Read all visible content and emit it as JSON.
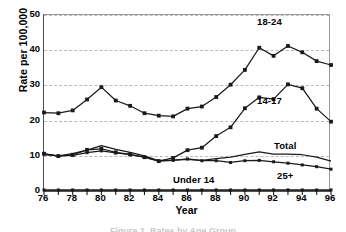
{
  "chart_data": {
    "type": "line",
    "title": "",
    "xlabel": "Year",
    "ylabel": "Rate per 100,000",
    "xlim": [
      76,
      96
    ],
    "ylim": [
      0,
      50
    ],
    "ytick_values": [
      0,
      10,
      20,
      30,
      40,
      50
    ],
    "ytick_labels": [
      "0",
      "10",
      "20",
      "30",
      "40",
      "50"
    ],
    "xtick_values": [
      76,
      78,
      80,
      82,
      84,
      86,
      88,
      90,
      92,
      94,
      96
    ],
    "xtick_labels": [
      "76",
      "78",
      "80",
      "82",
      "84",
      "86",
      "88",
      "90",
      "92",
      "94",
      "96"
    ],
    "x": [
      76,
      77,
      78,
      79,
      80,
      81,
      82,
      83,
      84,
      85,
      86,
      87,
      88,
      89,
      90,
      91,
      92,
      93,
      94,
      95,
      96
    ],
    "grid": "horizontal-dashed",
    "legend_position": "inline-annotations",
    "series": [
      {
        "name": "18-24",
        "label": "18-24",
        "marker": "square",
        "color": "#1a1a1a",
        "values": [
          22.3,
          22.1,
          22.9,
          26.0,
          29.5,
          25.7,
          24.2,
          22.1,
          21.4,
          21.2,
          23.4,
          24.0,
          26.7,
          30.2,
          34.4,
          40.7,
          38.4,
          41.2,
          39.4,
          36.9,
          35.8
        ]
      },
      {
        "name": "14-17",
        "label": "14-17",
        "marker": "square",
        "color": "#1a1a1a",
        "values": [
          10.6,
          9.9,
          10.3,
          11.7,
          12.0,
          11.0,
          10.4,
          9.6,
          8.5,
          9.4,
          11.6,
          12.3,
          15.6,
          18.1,
          23.5,
          26.6,
          26.1,
          30.3,
          29.2,
          23.4,
          19.7
        ]
      },
      {
        "name": "Total",
        "label": "Total",
        "marker": "none",
        "color": "#1a1a1a",
        "values": [
          10.3,
          10.0,
          10.6,
          11.6,
          12.9,
          11.8,
          11.0,
          10.0,
          8.6,
          8.8,
          9.0,
          8.7,
          9.2,
          9.6,
          10.4,
          11.1,
          10.5,
          10.5,
          10.3,
          9.6,
          8.5
        ]
      },
      {
        "name": "25+",
        "label": "25+",
        "marker": "square",
        "color": "#1a1a1a",
        "values": [
          10.5,
          10.0,
          10.1,
          10.9,
          11.4,
          10.8,
          10.3,
          9.6,
          8.5,
          8.7,
          9.1,
          8.6,
          8.6,
          8.1,
          8.6,
          8.7,
          8.3,
          7.9,
          7.4,
          6.9,
          6.2
        ]
      },
      {
        "name": "Under 14",
        "label": "Under 14",
        "marker": "square",
        "color": "#1a1a1a",
        "values": [
          0.3,
          0.3,
          0.3,
          0.3,
          0.3,
          0.3,
          0.3,
          0.3,
          0.3,
          0.3,
          0.3,
          0.3,
          0.3,
          0.3,
          0.3,
          0.3,
          0.3,
          0.3,
          0.3,
          0.3,
          0.3
        ]
      }
    ]
  },
  "annotations": {
    "label_18_24": "18-24",
    "label_14_17": "14-17",
    "label_total": "Total",
    "label_25_plus": "25+",
    "label_under_14": "Under 14"
  },
  "caption": "Figure 1. Rates by Age Group"
}
